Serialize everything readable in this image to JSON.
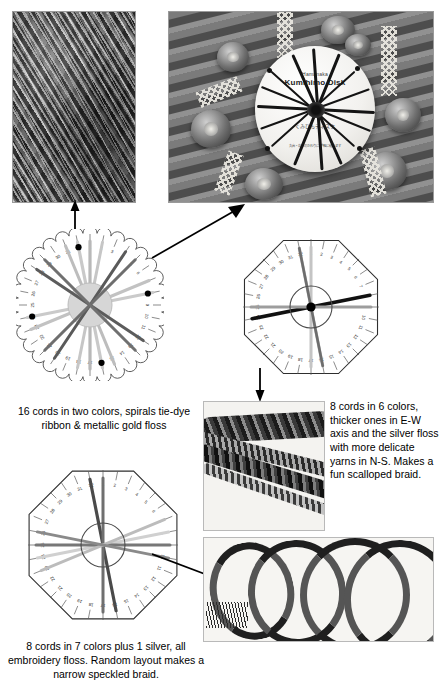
{
  "photos": {
    "cords_macro": {
      "name": "close-up of braided cords"
    },
    "disk_on_deck": {
      "name": "kumihimo disk with cords on wooden deck",
      "disk_brand_small": "Hamanaka",
      "disk_brand": "Kumihimo Disk",
      "disk_jp": "くみひもディスク",
      "disk_jp_small": "丸台・角台のかわりに\n手軽に組めます"
    },
    "braid_scalloped": {
      "name": "scalloped braid close-up"
    },
    "braid_long": {
      "name": "long speckled braid coiled"
    }
  },
  "disks": [
    {
      "id": "disk-16cords",
      "shape": "scalloped-circle",
      "slots": 32,
      "slot_labels": [
        "1",
        "2",
        "3",
        "4",
        "5",
        "6",
        "7",
        "8",
        "9",
        "10",
        "11",
        "12",
        "13",
        "14",
        "15",
        "16",
        "17",
        "18",
        "19",
        "20",
        "21",
        "22",
        "23",
        "24",
        "25",
        "26",
        "27",
        "28",
        "29",
        "30",
        "31",
        "32"
      ],
      "marker_slots": [
        32,
        8,
        16,
        24
      ],
      "cords": [
        {
          "from": 1,
          "to": 17,
          "color": "#b8b8b8",
          "width": 3.2
        },
        {
          "from": 2,
          "to": 18,
          "color": "#c6c6c6",
          "width": 3.0
        },
        {
          "from": 4,
          "to": 20,
          "color": "#5a5a5a",
          "width": 3.0
        },
        {
          "from": 5,
          "to": 21,
          "color": "#6e6e6e",
          "width": 3.0
        },
        {
          "from": 7,
          "to": 23,
          "color": "#c2c2c2",
          "width": 3.0
        },
        {
          "from": 8,
          "to": 24,
          "color": "#cacaca",
          "width": 3.2
        },
        {
          "from": 12,
          "to": 28,
          "color": "#5c5c5c",
          "width": 3.0
        },
        {
          "from": 13,
          "to": 29,
          "color": "#707070",
          "width": 3.0
        },
        {
          "from": 15,
          "to": 31,
          "color": "#bdbdbd",
          "width": 3.0
        },
        {
          "from": 16,
          "to": 32,
          "color": "#c9c9c9",
          "width": 3.2
        }
      ]
    },
    {
      "id": "disk-8cords-6col",
      "shape": "octagon-notched",
      "slots": 32,
      "cords": [
        {
          "from": 32,
          "to": 16,
          "color": "#b4b4b4",
          "width": 3.0
        },
        {
          "from": 1,
          "to": 17,
          "color": "#c4c4c4",
          "width": 3.0
        },
        {
          "from": 8,
          "to": 24,
          "color": "#111111",
          "width": 3.6
        },
        {
          "from": 9,
          "to": 25,
          "color": "#9d9d9d",
          "width": 3.0
        },
        {
          "from": 16,
          "to": 32,
          "color": "#6d6d6d",
          "width": 2.6
        }
      ]
    },
    {
      "id": "disk-8cords-7col",
      "shape": "octagon-notched",
      "slots": 32,
      "cords": [
        {
          "from": 32,
          "to": 16,
          "color": "#4a4a4a",
          "width": 3.2
        },
        {
          "from": 1,
          "to": 17,
          "color": "#6f6f6f",
          "width": 3.0
        },
        {
          "from": 8,
          "to": 24,
          "color": "#d0d0d0",
          "width": 3.0
        },
        {
          "from": 9,
          "to": 25,
          "color": "#777777",
          "width": 3.0
        },
        {
          "from": 7,
          "to": 23,
          "color": "#bcbcbc",
          "width": 2.8
        },
        {
          "from": 10,
          "to": 26,
          "color": "#8a8a8a",
          "width": 2.8
        }
      ]
    }
  ],
  "captions": {
    "caption_16cords": "16 cords in two colors, spirals tie-dye ribbon & metallic gold floss",
    "caption_8cords_6col": "8 cords in 6 colors, thicker ones in E-W axis and the silver floss with more delicate yarns in N-S. Makes a fun scalloped braid.",
    "caption_8cords_7col": "8 cords in 7 colors plus 1 silver, all embroidery floss. Random layout makes a narrow speckled braid."
  },
  "arrows": [
    {
      "name": "arrow-disk1-to-cords-photo",
      "direction": "up"
    },
    {
      "name": "arrow-disk1-to-deck-photo",
      "direction": "up-right"
    },
    {
      "name": "arrow-disk2-to-braid-photo",
      "direction": "down"
    },
    {
      "name": "arrow-disk3-to-braid-photo",
      "direction": "right"
    }
  ]
}
